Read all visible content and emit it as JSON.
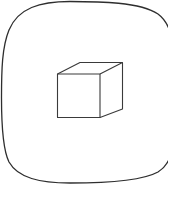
{
  "icon": {
    "name": "3d-object-icon",
    "label": "3D cube",
    "stroke_color": "#3a3a3a",
    "outline_color": "#2e2e2e",
    "background": "#ffffff"
  }
}
